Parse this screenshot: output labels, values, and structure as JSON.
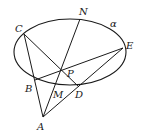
{
  "diagram": {
    "type": "geometry",
    "plane_label": "α",
    "points": {
      "N": {
        "label": "N",
        "x": 80,
        "y": 19,
        "lx": 80,
        "ly": 16
      },
      "C": {
        "label": "C",
        "x": 24,
        "y": 34,
        "lx": 16,
        "ly": 33
      },
      "E": {
        "label": "E",
        "x": 123,
        "y": 48,
        "lx": 127,
        "ly": 49
      },
      "B": {
        "label": "B",
        "x": 35,
        "y": 80,
        "lx": 26,
        "ly": 93
      },
      "P": {
        "label": "P",
        "x": 61,
        "y": 71,
        "lx": 68,
        "ly": 76
      },
      "M": {
        "label": "M",
        "x": 54,
        "y": 87,
        "lx": 54,
        "ly": 98
      },
      "D": {
        "label": "D",
        "x": 79,
        "y": 87,
        "lx": 75,
        "ly": 98
      },
      "A": {
        "label": "A",
        "x": 43,
        "y": 117,
        "lx": 37,
        "ly": 130
      }
    },
    "segments": [
      [
        "A",
        "C"
      ],
      [
        "A",
        "N"
      ],
      [
        "A",
        "E"
      ],
      [
        "C",
        "D"
      ],
      [
        "B",
        "E"
      ]
    ],
    "ellipse": {
      "cx": 70,
      "cy": 52,
      "rx": 56,
      "ry": 33
    },
    "stroke_color": "#1a1a1a"
  }
}
